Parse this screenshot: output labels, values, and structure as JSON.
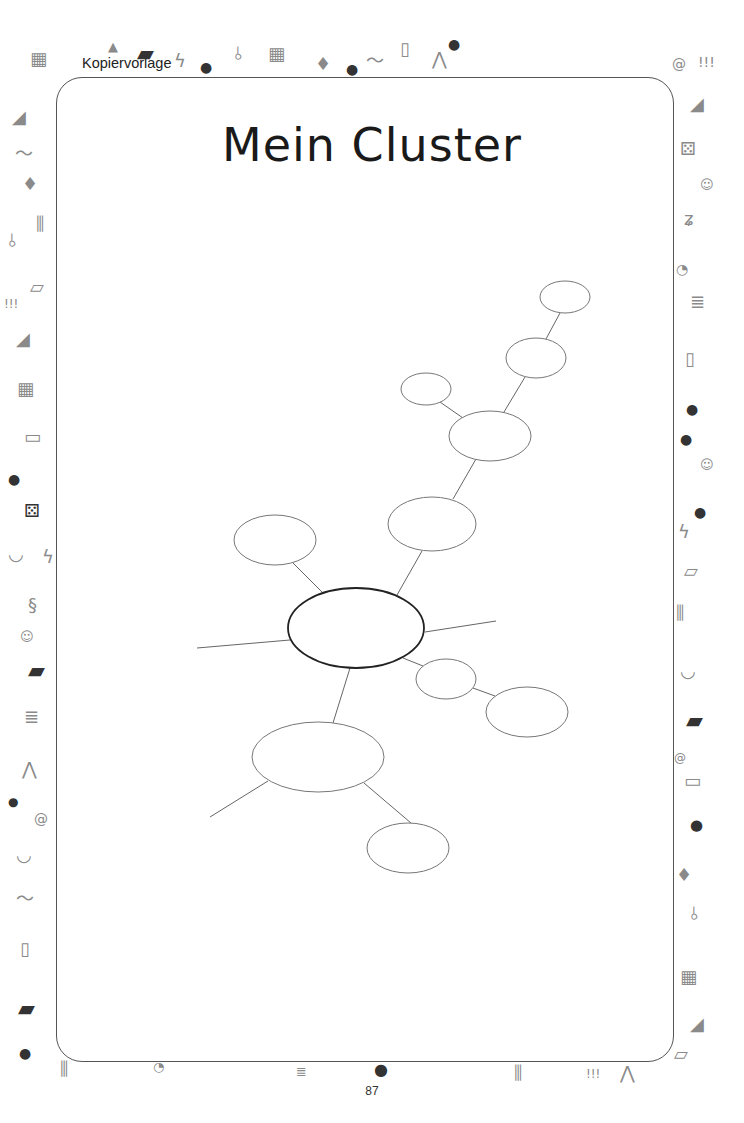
{
  "header": {
    "label": "Kopiervorlage"
  },
  "worksheet": {
    "title": "Mein Cluster",
    "page_number": "87"
  },
  "cluster": {
    "center": {
      "cx": 356,
      "cy": 628,
      "rx": 68,
      "ry": 40
    },
    "nodes": [
      {
        "id": "top-right",
        "cx": 565,
        "cy": 297,
        "rx": 25,
        "ry": 16
      },
      {
        "id": "upper-right",
        "cx": 536,
        "cy": 358,
        "rx": 30,
        "ry": 20
      },
      {
        "id": "small-upper-left",
        "cx": 426,
        "cy": 389,
        "rx": 25,
        "ry": 16
      },
      {
        "id": "middle",
        "cx": 490,
        "cy": 436,
        "rx": 41,
        "ry": 25
      },
      {
        "id": "lower-middle",
        "cx": 432,
        "cy": 524,
        "rx": 44,
        "ry": 27
      },
      {
        "id": "left",
        "cx": 275,
        "cy": 540,
        "rx": 41,
        "ry": 25
      },
      {
        "id": "small-right",
        "cx": 446,
        "cy": 679,
        "rx": 30,
        "ry": 20
      },
      {
        "id": "right",
        "cx": 527,
        "cy": 712,
        "rx": 41,
        "ry": 25
      },
      {
        "id": "big-lower-left",
        "cx": 318,
        "cy": 757,
        "rx": 66,
        "ry": 35
      },
      {
        "id": "bottom",
        "cx": 408,
        "cy": 848,
        "rx": 41,
        "ry": 25
      }
    ],
    "lines": [
      [
        197,
        648,
        290,
        640
      ],
      [
        425,
        632,
        496,
        621
      ],
      [
        350,
        668,
        333,
        723
      ],
      [
        268,
        781,
        210,
        817
      ],
      [
        364,
        783,
        411,
        823
      ],
      [
        403,
        658,
        423,
        666
      ],
      [
        473,
        688,
        495,
        696
      ],
      [
        397,
        595,
        422,
        551
      ],
      [
        453,
        499,
        476,
        459
      ],
      [
        463,
        418,
        440,
        402
      ],
      [
        504,
        412,
        525,
        377
      ],
      [
        546,
        339,
        560,
        313
      ],
      [
        323,
        593,
        293,
        563
      ]
    ]
  },
  "decorations": {
    "icons": [
      "puzzle",
      "hat",
      "briefcase",
      "lightning",
      "medal",
      "paperclip",
      "puzzle",
      "graduation-cap",
      "percent-balloon",
      "mustache",
      "jar",
      "compass",
      "medal",
      "spiral",
      "exclamation",
      "shoe",
      "dice",
      "kid",
      "pencil-zigzag",
      "alarm-clock",
      "book-stack",
      "jar",
      "medal-m",
      "medal",
      "kid",
      "medal-e",
      "lightning",
      "eraser",
      "pencil-cup",
      "laurel",
      "briefcase",
      "spiral",
      "computer",
      "percent-balloon",
      "graduation-cap",
      "paperclip",
      "puzzle",
      "shoe",
      "eraser",
      "mustache",
      "graduation-cap",
      "pencils",
      "paperclip",
      "eraser",
      "exclamation",
      "shoe",
      "puzzle",
      "computer",
      "medal",
      "dice",
      "laurel",
      "lightning",
      "snake",
      "kid",
      "briefcase",
      "book-stack",
      "compass",
      "medal-e",
      "spiral",
      "laurel",
      "mustache",
      "jar",
      "briefcase",
      "medal-m"
    ]
  }
}
